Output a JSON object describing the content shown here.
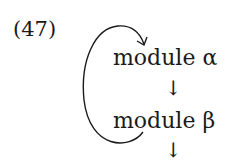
{
  "example_number": "(47)",
  "nodes": [
    {
      "label": "module α"
    },
    {
      "label": "module β"
    }
  ],
  "arrows": {
    "down": "↓",
    "loop": "from module β back to module α"
  }
}
